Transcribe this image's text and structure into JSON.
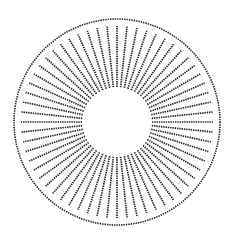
{
  "figure": {
    "width": 233,
    "height": 245,
    "background": "#ffffff",
    "stroke_color": "#222222",
    "center": {
      "x": 117,
      "y": 122
    },
    "outer_circle": {
      "radius": 103,
      "stroke_width": 1.6,
      "dasharray": "1.4 1"
    },
    "inner_radius": 35,
    "ray_outer_radius": 96,
    "rays": {
      "count": 60,
      "start_angle_deg": 0,
      "stroke_width": 1.7,
      "dasharray": "1.4 0.9"
    }
  }
}
